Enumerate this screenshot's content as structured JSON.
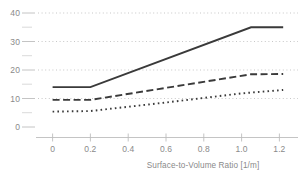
{
  "chart_data": {
    "type": "line",
    "title": "",
    "subtitle": "",
    "xlabel": "Surface-to-Volume Ratio [1/m]",
    "ylabel": "",
    "xlim": [
      -0.07,
      1.29
    ],
    "ylim": [
      0,
      41.5
    ],
    "grid": "horizontal-dotted",
    "legend_position": "none",
    "xticks": [
      0,
      0.2,
      0.4,
      0.6,
      0.8,
      1.0,
      1.2
    ],
    "xticklabels": [
      "0",
      "0.2",
      "0.4",
      "0.6",
      "0.8",
      "1.0",
      "1.2"
    ],
    "yticks": [
      0,
      10,
      20,
      30,
      40
    ],
    "yticklabels": [
      "0",
      "10",
      "20",
      "30",
      "40"
    ],
    "yminorticks": [
      5,
      15,
      25,
      35
    ],
    "gridlines": [
      10,
      20,
      30,
      40
    ],
    "series": [
      {
        "name": "solid-series",
        "style": "solid",
        "color": "#3a3a3a",
        "x": [
          0.0,
          0.2,
          1.05,
          1.22
        ],
        "values": [
          14.0,
          14.0,
          35.0,
          35.0
        ]
      },
      {
        "name": "dashed-series",
        "style": "dashed",
        "color": "#3a3a3a",
        "x": [
          0.0,
          0.2,
          1.05,
          1.22
        ],
        "values": [
          9.5,
          9.5,
          18.5,
          18.6
        ]
      },
      {
        "name": "dotted-series",
        "style": "dotted",
        "color": "#3a3a3a",
        "x": [
          0.0,
          0.2,
          0.6,
          1.0,
          1.22
        ],
        "values": [
          5.4,
          5.6,
          8.6,
          11.8,
          13.0
        ]
      }
    ]
  },
  "axes": {
    "x_axis_title": "Surface-to-Volume Ratio [1/m]"
  },
  "colors": {
    "series_stroke": "#3a3a3a",
    "gridline": "#b9b9b9",
    "axis": "#bdbdbd",
    "tick_label": "#8a8a8a",
    "background": "#ffffff"
  }
}
